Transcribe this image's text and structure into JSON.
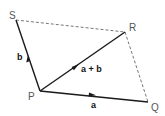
{
  "diagram": {
    "points": {
      "S": {
        "label": "S",
        "x": 16,
        "y": 20
      },
      "R": {
        "label": "R",
        "x": 125,
        "y": 32
      },
      "P": {
        "label": "P",
        "x": 40,
        "y": 91
      },
      "Q": {
        "label": "Q",
        "x": 148,
        "y": 102
      }
    },
    "vectors": [
      {
        "name": "a",
        "label": "a",
        "from": "P",
        "to": "Q"
      },
      {
        "name": "b",
        "label": "b",
        "from": "P",
        "to": "S"
      },
      {
        "name": "a+b",
        "label": "a + b",
        "from": "P",
        "to": "R"
      }
    ],
    "dashed_edges": [
      {
        "from": "S",
        "to": "R"
      },
      {
        "from": "R",
        "to": "Q"
      }
    ],
    "colors": {
      "vector": "#1a1a1a",
      "dashed": "#555555",
      "point_label": "#555555"
    }
  }
}
